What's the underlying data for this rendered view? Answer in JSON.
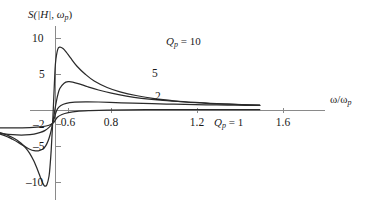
{
  "chart_data": {
    "type": "line",
    "title": "",
    "ylabel": "S(|H|, ωp)",
    "xlabel": "ω/ωp",
    "xlim": [
      0.45,
      1.95
    ],
    "ylim": [
      -12.5,
      12.0
    ],
    "grid": false,
    "legend_position": "inline-curve-labels",
    "xticks": [
      0.6,
      0.8,
      1.2,
      1.6
    ],
    "xtick_labels": [
      "0.6",
      "0.8",
      "1.2",
      "1.6"
    ],
    "yticks": [
      10,
      5,
      -2,
      -5,
      -10
    ],
    "ytick_labels": [
      "10",
      "5",
      "–2",
      "–5",
      "–10"
    ],
    "zero_crossing_x": 1.0,
    "left_asymptote": -2,
    "annotations": [
      {
        "text": "Qp = 10",
        "x": 1.18,
        "y": 8.0
      },
      {
        "text": "5",
        "x": 1.05,
        "y": 5.0
      },
      {
        "text": "2",
        "x": 1.06,
        "y": 1.9
      },
      {
        "text": "Qp = 1",
        "x": 1.4,
        "y": -2.2
      }
    ],
    "series": [
      {
        "name": "Qp = 10",
        "Q": 10,
        "peak": {
          "x": 1.05,
          "y": 8.8
        },
        "min": {
          "x": 0.95,
          "y": -10.5
        },
        "points": [
          [
            0.45,
            -2.05
          ],
          [
            0.5,
            -2.1
          ],
          [
            0.55,
            -2.18
          ],
          [
            0.6,
            -2.3
          ],
          [
            0.65,
            -2.48
          ],
          [
            0.7,
            -2.75
          ],
          [
            0.75,
            -3.15
          ],
          [
            0.78,
            -3.48
          ],
          [
            0.8,
            -3.75
          ],
          [
            0.82,
            -4.1
          ],
          [
            0.84,
            -4.55
          ],
          [
            0.86,
            -5.15
          ],
          [
            0.88,
            -5.95
          ],
          [
            0.9,
            -7.05
          ],
          [
            0.91,
            -7.75
          ],
          [
            0.92,
            -8.5
          ],
          [
            0.93,
            -9.3
          ],
          [
            0.94,
            -10.05
          ],
          [
            0.95,
            -10.5
          ],
          [
            0.96,
            -10.3
          ],
          [
            0.97,
            -9.1
          ],
          [
            0.975,
            -7.6
          ],
          [
            0.98,
            -5.5
          ],
          [
            0.985,
            -2.8
          ],
          [
            0.99,
            0.4
          ],
          [
            0.995,
            3.8
          ],
          [
            1.0,
            6.6
          ],
          [
            1.01,
            8.45
          ],
          [
            1.02,
            8.8
          ],
          [
            1.035,
            8.6
          ],
          [
            1.05,
            8.1
          ],
          [
            1.07,
            7.3
          ],
          [
            1.1,
            6.15
          ],
          [
            1.14,
            5.0
          ],
          [
            1.18,
            4.1
          ],
          [
            1.24,
            3.2
          ],
          [
            1.3,
            2.6
          ],
          [
            1.38,
            2.05
          ],
          [
            1.46,
            1.65
          ],
          [
            1.55,
            1.35
          ],
          [
            1.65,
            1.12
          ],
          [
            1.75,
            0.95
          ],
          [
            1.85,
            0.82
          ],
          [
            1.95,
            0.72
          ]
        ]
      },
      {
        "name": "Qp = 5",
        "Q": 5,
        "peak": {
          "x": 1.08,
          "y": 4.0
        },
        "min": {
          "x": 0.91,
          "y": -5.6
        },
        "points": [
          [
            0.45,
            -2.05
          ],
          [
            0.5,
            -2.12
          ],
          [
            0.55,
            -2.22
          ],
          [
            0.6,
            -2.38
          ],
          [
            0.65,
            -2.6
          ],
          [
            0.7,
            -2.92
          ],
          [
            0.75,
            -3.35
          ],
          [
            0.78,
            -3.7
          ],
          [
            0.8,
            -4.0
          ],
          [
            0.83,
            -4.5
          ],
          [
            0.86,
            -5.05
          ],
          [
            0.88,
            -5.38
          ],
          [
            0.9,
            -5.58
          ],
          [
            0.92,
            -5.6
          ],
          [
            0.94,
            -5.38
          ],
          [
            0.95,
            -5.1
          ],
          [
            0.96,
            -4.6
          ],
          [
            0.97,
            -3.85
          ],
          [
            0.98,
            -2.75
          ],
          [
            0.99,
            -1.2
          ],
          [
            1.0,
            0.6
          ],
          [
            1.01,
            2.1
          ],
          [
            1.02,
            3.05
          ],
          [
            1.04,
            3.8
          ],
          [
            1.06,
            4.0
          ],
          [
            1.08,
            3.95
          ],
          [
            1.11,
            3.7
          ],
          [
            1.15,
            3.3
          ],
          [
            1.2,
            2.85
          ],
          [
            1.26,
            2.4
          ],
          [
            1.33,
            2.0
          ],
          [
            1.4,
            1.7
          ],
          [
            1.5,
            1.4
          ],
          [
            1.6,
            1.18
          ],
          [
            1.7,
            1.0
          ],
          [
            1.8,
            0.88
          ],
          [
            1.9,
            0.78
          ],
          [
            1.95,
            0.74
          ]
        ]
      },
      {
        "name": "Qp = 2",
        "Q": 2,
        "peak": {
          "x": 1.18,
          "y": 1.2
        },
        "min": {
          "x": 0.86,
          "y": -3.4
        },
        "points": [
          [
            0.45,
            -2.08
          ],
          [
            0.5,
            -2.18
          ],
          [
            0.55,
            -2.32
          ],
          [
            0.6,
            -2.52
          ],
          [
            0.65,
            -2.75
          ],
          [
            0.7,
            -3.0
          ],
          [
            0.74,
            -3.18
          ],
          [
            0.78,
            -3.32
          ],
          [
            0.82,
            -3.4
          ],
          [
            0.86,
            -3.4
          ],
          [
            0.9,
            -3.28
          ],
          [
            0.93,
            -3.05
          ],
          [
            0.95,
            -2.8
          ],
          [
            0.97,
            -2.35
          ],
          [
            0.985,
            -1.8
          ],
          [
            0.995,
            -1.05
          ],
          [
            1.0,
            -0.45
          ],
          [
            1.01,
            0.25
          ],
          [
            1.025,
            0.7
          ],
          [
            1.05,
            1.0
          ],
          [
            1.09,
            1.15
          ],
          [
            1.14,
            1.2
          ],
          [
            1.2,
            1.18
          ],
          [
            1.28,
            1.1
          ],
          [
            1.36,
            1.02
          ],
          [
            1.45,
            0.95
          ],
          [
            1.55,
            0.88
          ],
          [
            1.65,
            0.82
          ],
          [
            1.75,
            0.78
          ],
          [
            1.85,
            0.74
          ],
          [
            1.95,
            0.7
          ]
        ]
      },
      {
        "name": "Qp = 1",
        "Q": 1,
        "peak": {
          "x": 1.3,
          "y": 0.15
        },
        "min": {
          "x": 0.8,
          "y": -2.42
        },
        "points": [
          [
            0.45,
            -2.1
          ],
          [
            0.52,
            -2.18
          ],
          [
            0.58,
            -2.26
          ],
          [
            0.65,
            -2.34
          ],
          [
            0.72,
            -2.4
          ],
          [
            0.8,
            -2.42
          ],
          [
            0.88,
            -2.38
          ],
          [
            0.94,
            -2.25
          ],
          [
            0.97,
            -2.05
          ],
          [
            0.99,
            -1.7
          ],
          [
            1.0,
            -1.3
          ],
          [
            1.01,
            -0.9
          ],
          [
            1.03,
            -0.55
          ],
          [
            1.06,
            -0.3
          ],
          [
            1.1,
            -0.12
          ],
          [
            1.16,
            -0.02
          ],
          [
            1.24,
            0.06
          ],
          [
            1.34,
            0.1
          ],
          [
            1.46,
            0.12
          ],
          [
            1.58,
            0.12
          ],
          [
            1.7,
            0.12
          ],
          [
            1.82,
            0.12
          ],
          [
            1.95,
            0.12
          ]
        ]
      }
    ]
  },
  "labels": {
    "ylabel_main": "S(|H|, ω",
    "ylabel_sub": "p",
    "ylabel_close": ")",
    "xlabel_main": "ω/ω",
    "xlabel_sub": "p",
    "q10_prefix": "Q",
    "q10_sub": "p",
    "q10_value": " = 10",
    "q5": "5",
    "q2": "2",
    "q1_prefix": "Q",
    "q1_sub": "p",
    "q1_value": " = 1",
    "x1": "0.6",
    "x2": "0.8",
    "x3": "1.2",
    "x4": "1.6",
    "y1": "10",
    "y2": "5",
    "y3": "–2",
    "y4": "–5",
    "y5": "–10"
  }
}
